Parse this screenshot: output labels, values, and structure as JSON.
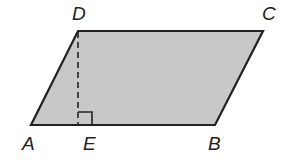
{
  "figure": {
    "type": "parallelogram",
    "fill_color": "#c8c8c8",
    "stroke_color": "#222222",
    "vertices": {
      "A": {
        "label": "A",
        "x": 31,
        "y": 125
      },
      "B": {
        "label": "B",
        "x": 215,
        "y": 125
      },
      "C": {
        "label": "C",
        "x": 263,
        "y": 31
      },
      "D": {
        "label": "D",
        "x": 78,
        "y": 31
      }
    },
    "foot_point": {
      "label": "E",
      "x": 78,
      "y": 125
    },
    "altitude": {
      "from": "D",
      "to": "E",
      "style": "dashed"
    },
    "right_angle_marker_at": "E"
  }
}
